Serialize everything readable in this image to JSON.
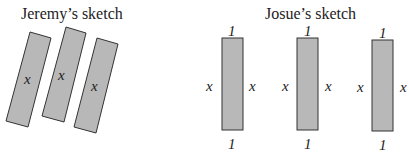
{
  "jeremy": {
    "title": "Jeremy’s sketch",
    "rects": [
      {
        "label": "x"
      },
      {
        "label": "x"
      },
      {
        "label": "x"
      }
    ]
  },
  "josue": {
    "title": "Josue’s sketch",
    "rects": [
      {
        "top": "1",
        "bottom": "1",
        "left": "x",
        "right": "x"
      },
      {
        "top": "1",
        "bottom": "1",
        "left": "x",
        "right": "x"
      },
      {
        "top": "1",
        "bottom": "1",
        "left": "x",
        "right": "x"
      }
    ]
  },
  "colors": {
    "fill": "#b8b8b8",
    "stroke": "#333333"
  }
}
